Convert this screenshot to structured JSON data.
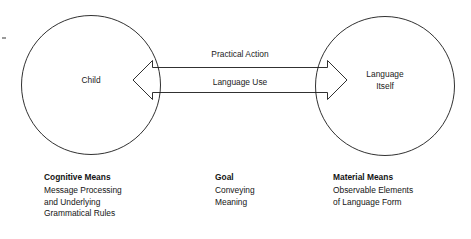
{
  "diagram": {
    "nodes": [
      {
        "id": "child",
        "label": "Child",
        "lines": [
          "Child"
        ]
      },
      {
        "id": "language-itself",
        "label": "Language Itself",
        "lines": [
          "Language",
          "Itself"
        ]
      }
    ],
    "connector": {
      "type": "double-headed-arrow",
      "labels": {
        "above": "Practical Action",
        "inside": "Language Use"
      }
    },
    "captions": [
      {
        "id": "cognitive-means",
        "title": "Cognitive Means",
        "lines": [
          "Message Processing",
          "and Underlying",
          "Grammatical Rules"
        ]
      },
      {
        "id": "goal",
        "title": "Goal",
        "lines": [
          "Conveying",
          "Meaning"
        ]
      },
      {
        "id": "material-means",
        "title": "Material Means",
        "lines": [
          "Observable Elements",
          "of Language Form"
        ]
      }
    ],
    "colors": {
      "stroke": "#1a1a1a",
      "text": "#141414",
      "background": "#ffffff"
    }
  }
}
